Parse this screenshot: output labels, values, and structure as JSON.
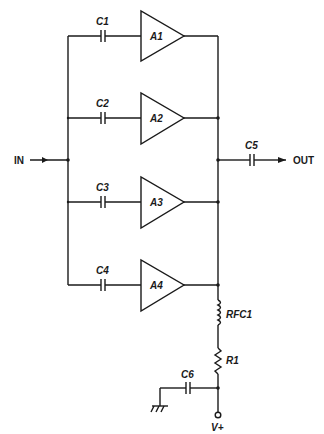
{
  "diagram": {
    "type": "schematic",
    "input_label": "IN",
    "output_label": "OUT",
    "supply_label": "V+",
    "amplifiers": [
      {
        "label": "A1",
        "cap": "C1"
      },
      {
        "label": "A2",
        "cap": "C2"
      },
      {
        "label": "A3",
        "cap": "C3"
      },
      {
        "label": "A4",
        "cap": "C4"
      }
    ],
    "output_cap": "C5",
    "choke": "RFC1",
    "resistor": "R1",
    "bypass_cap": "C6"
  }
}
